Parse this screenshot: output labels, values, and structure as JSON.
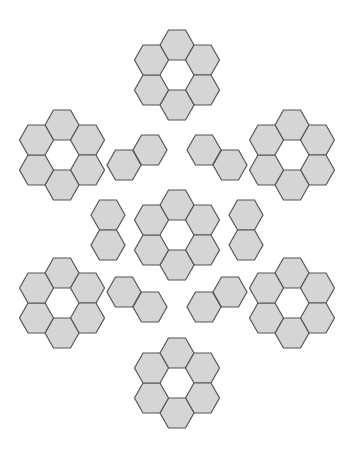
{
  "figure": {
    "background_color": "#ffffff",
    "canvas": {
      "width": 352,
      "height": 452
    }
  },
  "style": {
    "hex_fill": "#d5d5d5",
    "hex_stroke": "#555555",
    "hex_stroke_width": 1.2,
    "hex_width": 34,
    "hex_height": 30,
    "orientation": "flat-top"
  },
  "legend": {
    "flower_label": "flower piece (6 hexagons around empty center)",
    "domino_label": "domino piece (2 joined hexagons)"
  },
  "pieces": [
    {
      "name": "flower-top-center",
      "type": "flower",
      "center": {
        "x": 177,
        "y": 75
      },
      "hex_count": 6
    },
    {
      "name": "flower-left-upper",
      "type": "flower",
      "center": {
        "x": 62,
        "y": 155
      },
      "hex_count": 6
    },
    {
      "name": "flower-right-upper",
      "type": "flower",
      "center": {
        "x": 292,
        "y": 155
      },
      "hex_count": 6
    },
    {
      "name": "flower-center",
      "type": "flower",
      "center": {
        "x": 177,
        "y": 235
      },
      "hex_count": 6
    },
    {
      "name": "flower-left-lower",
      "type": "flower",
      "center": {
        "x": 62,
        "y": 303
      },
      "hex_count": 6
    },
    {
      "name": "flower-right-lower",
      "type": "flower",
      "center": {
        "x": 292,
        "y": 303
      },
      "hex_count": 6
    },
    {
      "name": "flower-bottom-center",
      "type": "flower",
      "center": {
        "x": 177,
        "y": 383
      },
      "hex_count": 6
    },
    {
      "name": "domino-top-left",
      "type": "domino",
      "orientation": "diagonal-up-right",
      "hexes": [
        {
          "x": 124,
          "y": 165
        },
        {
          "x": 150,
          "y": 150
        }
      ],
      "hex_count": 2
    },
    {
      "name": "domino-top-right",
      "type": "domino",
      "orientation": "diagonal-down-right",
      "hexes": [
        {
          "x": 204,
          "y": 150
        },
        {
          "x": 230,
          "y": 165
        }
      ],
      "hex_count": 2
    },
    {
      "name": "domino-middle-left",
      "type": "domino",
      "orientation": "vertical",
      "hexes": [
        {
          "x": 108,
          "y": 215
        },
        {
          "x": 108,
          "y": 245
        }
      ],
      "hex_count": 2
    },
    {
      "name": "domino-middle-right",
      "type": "domino",
      "orientation": "vertical",
      "hexes": [
        {
          "x": 246,
          "y": 215
        },
        {
          "x": 246,
          "y": 245
        }
      ],
      "hex_count": 2
    },
    {
      "name": "domino-bottom-left",
      "type": "domino",
      "orientation": "diagonal-down-right",
      "hexes": [
        {
          "x": 124,
          "y": 292
        },
        {
          "x": 150,
          "y": 307
        }
      ],
      "hex_count": 2
    },
    {
      "name": "domino-bottom-right",
      "type": "domino",
      "orientation": "diagonal-up-right",
      "hexes": [
        {
          "x": 204,
          "y": 307
        },
        {
          "x": 230,
          "y": 292
        }
      ],
      "hex_count": 2
    }
  ],
  "counts": {
    "flower_pieces": 7,
    "domino_pieces": 6,
    "total_hexagons": 54
  }
}
